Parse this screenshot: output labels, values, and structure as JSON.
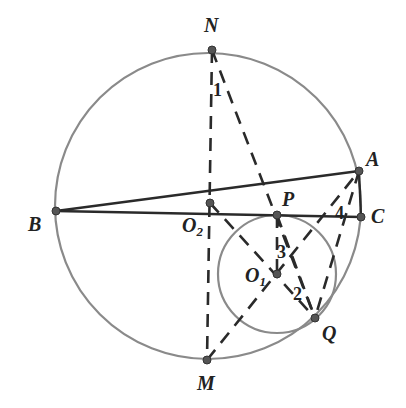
{
  "diagram": {
    "type": "geometry",
    "colors": {
      "circle": "#8a8a8a",
      "solid_line": "#2a2a2a",
      "dashed_line": "#2a2a2a",
      "point": "#555555"
    },
    "big_circle": {
      "cx": 208,
      "cy": 206,
      "r": 153
    },
    "small_circle": {
      "cx": 277,
      "cy": 274,
      "r": 59,
      "center_label": "O1"
    },
    "points": {
      "N": {
        "label": "N",
        "x": 212,
        "y": 50
      },
      "M": {
        "label": "M",
        "x": 207,
        "y": 360
      },
      "B": {
        "label": "B",
        "x": 56,
        "y": 211
      },
      "A": {
        "label": "A",
        "x": 359,
        "y": 171
      },
      "C": {
        "label": "C",
        "x": 361,
        "y": 217
      },
      "O2": {
        "label": "O",
        "sub": "2",
        "x": 210,
        "y": 203
      },
      "P": {
        "label": "P",
        "x": 277,
        "y": 215
      },
      "O1": {
        "label": "O",
        "sub": "1",
        "x": 277,
        "y": 274
      },
      "Q": {
        "label": "Q",
        "x": 315,
        "y": 318
      }
    },
    "angle_labels": {
      "a1": "1",
      "a2": "2",
      "a3": "3",
      "a4": "4"
    }
  }
}
